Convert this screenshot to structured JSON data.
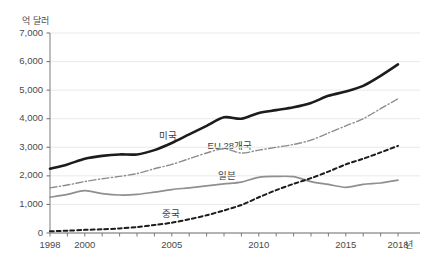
{
  "chart_data": {
    "type": "line",
    "title": "",
    "subtitle": "",
    "xlabel": "년",
    "ylabel": "억 달러",
    "xlim": [
      1998,
      2018
    ],
    "ylim": [
      0,
      7000
    ],
    "grid": true,
    "legend_position": "inline",
    "x": [
      1998,
      1999,
      2000,
      2001,
      2002,
      2003,
      2004,
      2005,
      2006,
      2007,
      2008,
      2009,
      2010,
      2011,
      2012,
      2013,
      2014,
      2015,
      2016,
      2017,
      2018
    ],
    "x_ticks": [
      "1998",
      "2000",
      "2005",
      "2010",
      "2015",
      "2018"
    ],
    "x_tick_values": [
      1998,
      2000,
      2005,
      2010,
      2015,
      2018
    ],
    "y_ticks": [
      "0",
      "1,000",
      "2,000",
      "3,000",
      "4,000",
      "5,000",
      "6,000",
      "7,000"
    ],
    "y_tick_values": [
      0,
      1000,
      2000,
      3000,
      4000,
      5000,
      6000,
      7000
    ],
    "series": [
      {
        "name": "미국",
        "label": "미국",
        "color": "#1c1c1c",
        "style": "solid",
        "width": 2.6,
        "label_x": 2004.2,
        "label_y": 3450,
        "values": [
          2250,
          2400,
          2600,
          2700,
          2750,
          2750,
          2900,
          3150,
          3450,
          3750,
          4050,
          4000,
          4200,
          4300,
          4400,
          4550,
          4800,
          4950,
          5150,
          5500,
          5900
        ]
      },
      {
        "name": "EU 28개국",
        "label": "EU 28개국",
        "color": "#8c8c8c",
        "style": "dashdot",
        "width": 1.4,
        "label_x": 2007.0,
        "label_y": 3100,
        "values": [
          1580,
          1680,
          1800,
          1900,
          1980,
          2080,
          2250,
          2400,
          2600,
          2800,
          2950,
          2800,
          2900,
          3000,
          3100,
          3250,
          3500,
          3750,
          4000,
          4350,
          4700
        ]
      },
      {
        "name": "일본",
        "label": "일본",
        "color": "#8f8f8f",
        "style": "solid",
        "width": 1.7,
        "label_x": 2007.6,
        "label_y": 2050,
        "values": [
          1250,
          1350,
          1480,
          1380,
          1330,
          1350,
          1430,
          1520,
          1580,
          1650,
          1720,
          1780,
          1950,
          1980,
          1970,
          1800,
          1700,
          1600,
          1700,
          1750,
          1850
        ]
      },
      {
        "name": "중국",
        "label": "중국",
        "color": "#1c1c1c",
        "style": "dashed",
        "width": 2.0,
        "label_x": 2004.4,
        "label_y": 730,
        "values": [
          60,
          80,
          110,
          130,
          160,
          210,
          280,
          360,
          480,
          620,
          790,
          980,
          1250,
          1500,
          1720,
          1920,
          2150,
          2400,
          2600,
          2820,
          3050
        ]
      }
    ]
  },
  "axes": {
    "y_unit": "억 달러",
    "x_unit": "년"
  }
}
